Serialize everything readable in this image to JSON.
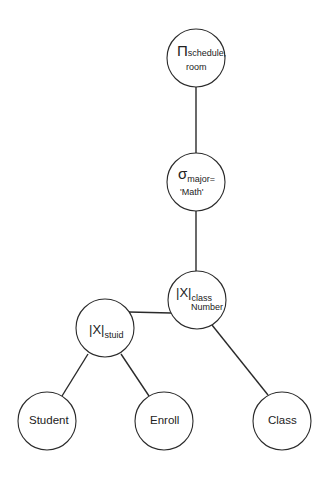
{
  "diagram": {
    "style": {
      "stroke": "#2a2a2a",
      "fill": "#ffffff",
      "text": "#222222",
      "node_radius": 29
    },
    "nodes": [
      {
        "id": "project",
        "type": "projection",
        "symbol": "Π",
        "subscript_line1": "schedule,",
        "subscript_line2": "room",
        "cx": 196,
        "cy": 58
      },
      {
        "id": "select",
        "type": "selection",
        "symbol": "σ",
        "subscript_line1": "major=",
        "subscript_line2": "'Math'",
        "cx": 196,
        "cy": 182
      },
      {
        "id": "join_class",
        "type": "join",
        "symbol": "|X|",
        "subscript_line1": "class",
        "subscript_line2": "Number",
        "cx": 197,
        "cy": 300
      },
      {
        "id": "join_stuid",
        "type": "join",
        "symbol": "|X|",
        "subscript_line1": "stuid",
        "cx": 105,
        "cy": 328
      },
      {
        "id": "student",
        "type": "relation",
        "label": "Student",
        "cx": 47,
        "cy": 421
      },
      {
        "id": "enroll",
        "type": "relation",
        "label": "Enroll",
        "cx": 164,
        "cy": 421
      },
      {
        "id": "class",
        "type": "relation",
        "label": "Class",
        "cx": 282,
        "cy": 421
      }
    ],
    "edges": [
      {
        "from": "project",
        "to": "select",
        "x1": 196,
        "y1": 87,
        "x2": 196,
        "y2": 153
      },
      {
        "from": "select",
        "to": "join_class",
        "x1": 196,
        "y1": 211,
        "x2": 196,
        "y2": 271
      },
      {
        "from": "join_class",
        "to": "join_stuid",
        "x1": 171,
        "y1": 313,
        "x2": 129,
        "y2": 312
      },
      {
        "from": "join_class",
        "to": "class",
        "x1": 212,
        "y1": 325,
        "x2": 268,
        "y2": 395
      },
      {
        "from": "join_stuid",
        "to": "student",
        "x1": 88,
        "y1": 354,
        "x2": 62,
        "y2": 396
      },
      {
        "from": "join_stuid",
        "to": "enroll",
        "x1": 121,
        "y1": 354,
        "x2": 149,
        "y2": 396
      }
    ]
  }
}
